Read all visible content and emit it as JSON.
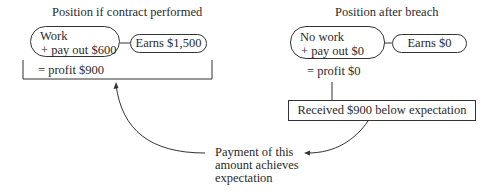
{
  "diagram": {
    "left": {
      "title": "Position if contract performed",
      "activity_line1": "Work",
      "activity_line2": "+ pay out $600",
      "earnings": "Earns $1,500",
      "result": "= profit $900"
    },
    "right": {
      "title": "Position after breach",
      "activity_line1": "No work",
      "activity_line2": "+ pay out $0",
      "earnings": "Earns $0",
      "result": "= profit $0",
      "shortfall": "Received $900 below expectation"
    },
    "note": {
      "line1": "Payment of this",
      "line2": "amount achieves",
      "line3": "expectation"
    },
    "colors": {
      "stroke": "#333333",
      "text": "#2a2a2a",
      "background": "#ffffff"
    }
  }
}
